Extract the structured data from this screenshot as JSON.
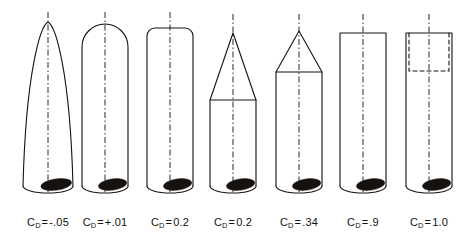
{
  "figure": {
    "background_color": "#ffffff",
    "ink_color": "#15120f",
    "line_width": 1.1,
    "centerline_dash": "6 2.5 1.5 2.5",
    "body_half_width": 23,
    "body_bottom_y": 186,
    "base_ellipse_ry": 7,
    "label_baseline_y": 216,
    "symbol": "C",
    "subscript": "D",
    "equals": "="
  },
  "shapes": [
    {
      "id": "parabolic-ogive-nose",
      "name": "parabolic ogive nose",
      "center_x": 48,
      "nose_tip_y": 22,
      "shoulder_y": 186,
      "body_half_width": 25,
      "tip_half_width": 0,
      "profile": "ogive",
      "centerline_top_y": 12,
      "cd_value": "-.05",
      "cd_sign": "negative",
      "label_text": "-.05"
    },
    {
      "id": "hemispherical-nose",
      "name": "rounded hemispherical nose",
      "center_x": 105,
      "nose_tip_y": 24,
      "shoulder_y": 50,
      "body_half_width": 23,
      "corner_radius": 23,
      "profile": "round",
      "centerline_top_y": 12,
      "cd_value": "+.01",
      "cd_sign": "positive",
      "label_text": "+.01"
    },
    {
      "id": "small-radius-flat-nose",
      "name": "flat nose with small corner radius",
      "center_x": 170,
      "nose_tip_y": 28,
      "shoulder_y": 40,
      "body_half_width": 23,
      "corner_radius": 8,
      "profile": "round",
      "centerline_top_y": 12,
      "cd_value": "0.2",
      "cd_sign": "positive",
      "label_text": "0.2"
    },
    {
      "id": "sharp-slender-cone-nose",
      "name": "sharp slender cone nose",
      "center_x": 233,
      "nose_tip_y": 33,
      "shoulder_y": 100,
      "body_half_width": 23,
      "profile": "cone",
      "centerline_top_y": 14,
      "cd_value": "0.2",
      "cd_sign": "positive",
      "label_text": "0.2"
    },
    {
      "id": "blunt-wide-cone-nose",
      "name": "blunt wide-angle cone nose",
      "center_x": 299,
      "nose_tip_y": 31,
      "shoulder_y": 72,
      "body_half_width": 23,
      "profile": "cone",
      "centerline_top_y": 14,
      "cd_value": ".34",
      "cd_sign": "positive",
      "label_text": ".34"
    },
    {
      "id": "flat-face-cylinder",
      "name": "flat faced cylinder",
      "center_x": 363,
      "nose_tip_y": 33,
      "shoulder_y": 33,
      "body_half_width": 23,
      "profile": "flat",
      "centerline_top_y": 14,
      "cd_value": ".9",
      "cd_sign": "positive",
      "label_text": ".9"
    },
    {
      "id": "hollow-cup-cylinder",
      "name": "hollow cupped cylinder",
      "center_x": 429,
      "nose_tip_y": 33,
      "shoulder_y": 33,
      "body_half_width": 23,
      "profile": "cup",
      "cavity_depth": 38,
      "cavity_inset": 3,
      "cavity_dash": "4 3",
      "centerline_top_y": 14,
      "cd_value": "1.0",
      "cd_sign": "positive",
      "label_text": "1.0"
    }
  ]
}
